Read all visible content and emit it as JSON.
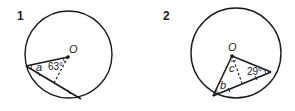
{
  "figures": [
    {
      "number": "1",
      "center_label": "O",
      "angle_label": "63°",
      "unknown_label": "a"
    },
    {
      "number": "2",
      "center_label": "O",
      "angle_label": "29°",
      "unknown_labels": [
        "b",
        "c"
      ]
    }
  ],
  "colors": {
    "stroke": "#1a1a1a",
    "background": "#ffffff"
  }
}
